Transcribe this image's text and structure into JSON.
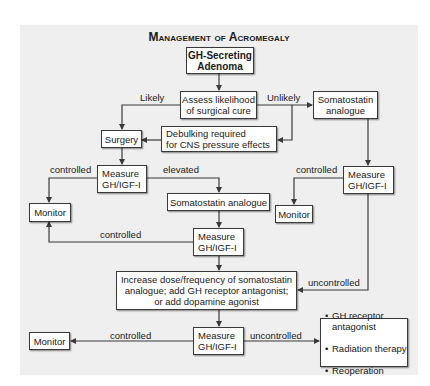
{
  "title": "Management of Acromegaly",
  "nodes": {
    "adenoma": "GH-Secreting\nAdenoma",
    "assess": "Assess likelihood\nof surgical cure",
    "surgery": "Surgery",
    "debulking": "Debulking required\n  for CNS pressure effects",
    "somatostatin_right": "Somatostatin\nanalogue",
    "measure_left": "Measure\n  GH/IGF-I",
    "measure_right": "Measure\n  GH/IGF-I",
    "monitor_left": "Monitor",
    "monitor_right": "Monitor",
    "somatostatin_mid": "Somatostatin analogue",
    "measure_mid": "Measure\n  GH/IGF-I",
    "increase": "Increase dose/frequency of somatostatin\nanalogue; add GH receptor antagonist;\nor add dopamine agonist",
    "measure_bottom": "Measure\n  GH/IGF-I",
    "monitor_bottom": "Monitor",
    "options": [
      "GH receptor antagonist",
      "Radiation therapy",
      "Reoperation"
    ]
  },
  "edge_labels": {
    "likely": "Likely",
    "unlikely": "Unlikely",
    "controlled_1": "controlled",
    "elevated": "elevated",
    "controlled_2": "controlled",
    "controlled_3": "controlled",
    "uncontrolled_1": "uncontrolled",
    "controlled_4": "controlled",
    "uncontrolled_2": "uncontrolled"
  },
  "colors": {
    "panel": "#efefef",
    "box": "#ffffff",
    "line": "#3a3a3a"
  }
}
